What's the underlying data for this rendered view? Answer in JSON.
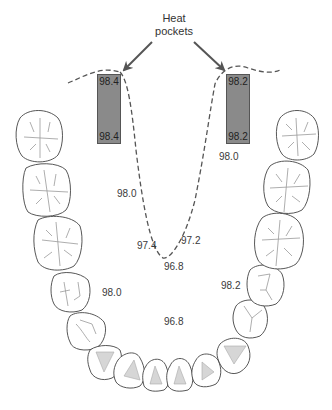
{
  "title": {
    "line1": "Heat",
    "line2": "pockets"
  },
  "pockets": [
    {
      "side": "left",
      "top_value": "98.4",
      "bottom_value": "98.4"
    },
    {
      "side": "right",
      "top_value": "98.2",
      "bottom_value": "98.2"
    }
  ],
  "readings": [
    {
      "id": "right-upper",
      "value": "98.0"
    },
    {
      "id": "left-mid",
      "value": "98.0"
    },
    {
      "id": "curve-left",
      "value": "97.4"
    },
    {
      "id": "curve-right",
      "value": "97.2"
    },
    {
      "id": "curve-bottom",
      "value": "96.8"
    },
    {
      "id": "left-lower",
      "value": "98.0"
    },
    {
      "id": "right-lower",
      "value": "98.2"
    },
    {
      "id": "center-floor",
      "value": "96.8"
    }
  ],
  "colors": {
    "pocket_fill": "#8a8a8a",
    "line": "#555555",
    "tooth_outline": "#444444"
  }
}
